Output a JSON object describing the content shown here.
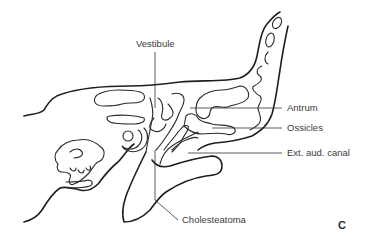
{
  "figure": {
    "panel_letter": "C",
    "labels": {
      "vestibule": "Vestibule",
      "antrum": "Antrum",
      "ossicles": "Ossicles",
      "ext_aud_canal": "Ext. aud. canal",
      "cholesteatoma": "Cholesteatoma"
    },
    "colors": {
      "line": "#1e1e1e",
      "text": "#3a3a3a",
      "background": "#ffffff"
    }
  }
}
